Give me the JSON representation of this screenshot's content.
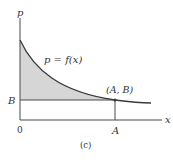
{
  "figure": {
    "caption": "(c)",
    "y_axis_label": "p",
    "x_axis_label": "x",
    "origin_label": "0",
    "y_tick_label": "B",
    "x_tick_label": "A",
    "curve_label": "p = f(x)",
    "point_label": "(A, B)"
  },
  "colors": {
    "axis": "#4a4a4a",
    "curve": "#3a3a3a",
    "shade": "#d6d6d6",
    "text": "#333333"
  }
}
